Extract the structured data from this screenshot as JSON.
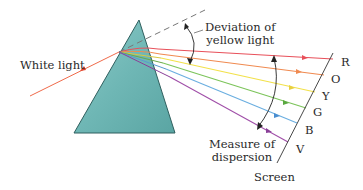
{
  "labels": {
    "white_light": "White light",
    "deviation_line1": "Deviation of",
    "deviation_line2": "yellow light",
    "measure_line1": "Measure of",
    "measure_line2": "dispersion",
    "screen": "Screen"
  },
  "spectrum": [
    {
      "letter": "R",
      "color": "#e8505a"
    },
    {
      "letter": "O",
      "color": "#f08a50"
    },
    {
      "letter": "Y",
      "color": "#f2e14a"
    },
    {
      "letter": "G",
      "color": "#7cc45a"
    },
    {
      "letter": "B",
      "color": "#6aaee0"
    },
    {
      "letter": "V",
      "color": "#a04fa8"
    }
  ],
  "colors": {
    "prism_fill": "#6bb5b3",
    "prism_edge": "#2f5f5e",
    "incident_ray": "#f06a4a",
    "dashed_line": "#777777",
    "annotation": "#222222"
  }
}
